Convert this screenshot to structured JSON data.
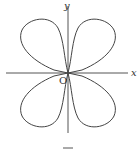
{
  "figure": {
    "x_label": "x",
    "y_label": "y",
    "origin_label": "O",
    "curve": "four-leaf rose (four petals in quadrants)",
    "stroke_color": "#444444"
  }
}
